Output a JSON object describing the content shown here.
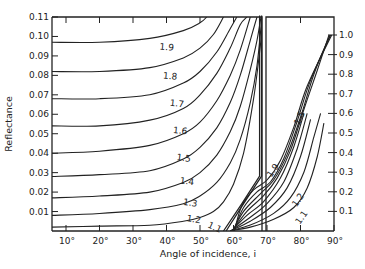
{
  "chart_data": {
    "type": "line",
    "title": "",
    "xlabel": "Angle of incidence, i",
    "ylabel_left": "Reflectance",
    "ylabel_right": "",
    "x_ticks": [
      "10°",
      "20°",
      "30°",
      "40°",
      "50°",
      "60°",
      "70°",
      "80°",
      "90°"
    ],
    "x_tick_values": [
      10,
      20,
      30,
      40,
      50,
      60,
      70,
      80,
      90
    ],
    "y_left_ticks": [
      "0.01",
      "0.02",
      "0.03",
      "0.04",
      "0.05",
      "0.06",
      "0.07",
      "0.08",
      "0.09",
      "0.10",
      "0.11"
    ],
    "y_left_values": [
      0.01,
      0.02,
      0.03,
      0.04,
      0.05,
      0.06,
      0.07,
      0.08,
      0.09,
      0.1,
      0.11
    ],
    "y_right_ticks": [
      "0.1",
      "0.2",
      "0.3",
      "0.4",
      "0.5",
      "0.6",
      "0.7",
      "0.8",
      "0.9",
      "1.0"
    ],
    "y_right_values": [
      0.1,
      0.2,
      0.3,
      0.4,
      0.5,
      0.6,
      0.7,
      0.8,
      0.9,
      1.0
    ],
    "left_panel": {
      "xlim": [
        5.8,
        68.8
      ],
      "ylim": [
        0,
        0.11
      ],
      "scale": "left"
    },
    "right_panel": {
      "xlim": [
        69.9,
        90
      ],
      "ylim": [
        0,
        1.1
      ],
      "scale": "right"
    },
    "grid": false,
    "legend": "inline curve labels (refractive index)",
    "series_left": [
      {
        "name": "1.9",
        "points": [
          [
            5.8,
            0.097
          ],
          [
            20,
            0.097
          ],
          [
            35,
            0.099
          ],
          [
            45,
            0.103
          ],
          [
            50,
            0.107
          ],
          [
            52,
            0.11
          ]
        ]
      },
      {
        "name": "1.8",
        "points": [
          [
            5.8,
            0.082
          ],
          [
            20,
            0.082
          ],
          [
            35,
            0.084
          ],
          [
            45,
            0.089
          ],
          [
            50,
            0.094
          ],
          [
            54,
            0.101
          ],
          [
            57,
            0.11
          ]
        ]
      },
      {
        "name": "1.7",
        "points": [
          [
            5.8,
            0.068
          ],
          [
            20,
            0.068
          ],
          [
            35,
            0.07
          ],
          [
            45,
            0.076
          ],
          [
            50,
            0.082
          ],
          [
            55,
            0.092
          ],
          [
            59,
            0.104
          ],
          [
            61,
            0.11
          ]
        ]
      },
      {
        "name": "1.6",
        "points": [
          [
            5.8,
            0.054
          ],
          [
            20,
            0.054
          ],
          [
            35,
            0.057
          ],
          [
            45,
            0.063
          ],
          [
            50,
            0.07
          ],
          [
            55,
            0.081
          ],
          [
            59,
            0.094
          ],
          [
            62,
            0.106
          ],
          [
            64,
            0.11
          ]
        ]
      },
      {
        "name": "1.5",
        "points": [
          [
            5.8,
            0.04
          ],
          [
            20,
            0.041
          ],
          [
            35,
            0.044
          ],
          [
            45,
            0.05
          ],
          [
            50,
            0.056
          ],
          [
            55,
            0.067
          ],
          [
            59,
            0.08
          ],
          [
            62,
            0.093
          ],
          [
            65,
            0.11
          ]
        ]
      },
      {
        "name": "1.4",
        "points": [
          [
            5.8,
            0.028
          ],
          [
            20,
            0.029
          ],
          [
            35,
            0.031
          ],
          [
            45,
            0.037
          ],
          [
            50,
            0.043
          ],
          [
            55,
            0.053
          ],
          [
            59,
            0.066
          ],
          [
            62,
            0.08
          ],
          [
            65,
            0.098
          ],
          [
            67,
            0.11
          ]
        ]
      },
      {
        "name": "1.3",
        "points": [
          [
            5.8,
            0.017
          ],
          [
            20,
            0.018
          ],
          [
            35,
            0.02
          ],
          [
            45,
            0.025
          ],
          [
            50,
            0.03
          ],
          [
            55,
            0.039
          ],
          [
            59,
            0.051
          ],
          [
            62,
            0.064
          ],
          [
            65,
            0.083
          ],
          [
            67,
            0.098
          ],
          [
            68.2,
            0.11
          ]
        ]
      },
      {
        "name": "1.2",
        "points": [
          [
            5.8,
            0.008
          ],
          [
            20,
            0.009
          ],
          [
            35,
            0.011
          ],
          [
            45,
            0.014
          ],
          [
            50,
            0.018
          ],
          [
            55,
            0.025
          ],
          [
            59,
            0.035
          ],
          [
            62,
            0.047
          ],
          [
            65,
            0.066
          ],
          [
            67,
            0.085
          ],
          [
            68.5,
            0.11
          ]
        ]
      },
      {
        "name": "1.1",
        "points": [
          [
            5.8,
            0.002
          ],
          [
            20,
            0.0025
          ],
          [
            35,
            0.003
          ],
          [
            45,
            0.005
          ],
          [
            50,
            0.007
          ],
          [
            54,
            0.01
          ],
          [
            57,
            0.015
          ],
          [
            60,
            0.024
          ],
          [
            63,
            0.04
          ],
          [
            66,
            0.068
          ],
          [
            68,
            0.095
          ],
          [
            68.8,
            0.11
          ]
        ]
      }
    ],
    "series_right": [
      {
        "name": "1.1",
        "points": [
          [
            58.5,
            0.0
          ],
          [
            65,
            0.02
          ],
          [
            72,
            0.06
          ],
          [
            78,
            0.12
          ],
          [
            82,
            0.22
          ],
          [
            85,
            0.38
          ],
          [
            87,
            0.55
          ]
        ]
      },
      {
        "name": "1.2",
        "points": [
          [
            58.8,
            0.0
          ],
          [
            65,
            0.03
          ],
          [
            72,
            0.09
          ],
          [
            77,
            0.17
          ],
          [
            81,
            0.3
          ],
          [
            84,
            0.48
          ],
          [
            86,
            0.6
          ]
        ]
      },
      {
        "name": "1.3",
        "points": [
          [
            59,
            0.0
          ],
          [
            65,
            0.05
          ],
          [
            71,
            0.12
          ],
          [
            76,
            0.22
          ],
          [
            80,
            0.38
          ],
          [
            83,
            0.57
          ]
        ]
      },
      {
        "name": "1.4",
        "points": [
          [
            59.2,
            0.0
          ],
          [
            65,
            0.07
          ],
          [
            70,
            0.14
          ],
          [
            75,
            0.25
          ],
          [
            79,
            0.42
          ],
          [
            82,
            0.6
          ]
        ]
      },
      {
        "name": "1.5",
        "points": [
          [
            59.4,
            0.0
          ],
          [
            64,
            0.08
          ],
          [
            69,
            0.15
          ],
          [
            74,
            0.27
          ],
          [
            78,
            0.43
          ],
          [
            81,
            0.6
          ]
        ]
      },
      {
        "name": "1.6",
        "points": [
          [
            59.6,
            0.0
          ],
          [
            64,
            0.1
          ],
          [
            69,
            0.18
          ],
          [
            73,
            0.27
          ],
          [
            77,
            0.41
          ],
          [
            81,
            0.62
          ],
          [
            85,
            0.82
          ],
          [
            88.5,
            1.0
          ]
        ]
      },
      {
        "name": "1.7",
        "points": [
          [
            59.8,
            0.0
          ],
          [
            63,
            0.1
          ],
          [
            68,
            0.19
          ],
          [
            72,
            0.26
          ],
          [
            76,
            0.39
          ],
          [
            80,
            0.58
          ],
          [
            84,
            0.8
          ],
          [
            88.8,
            1.0
          ]
        ]
      },
      {
        "name": "1.8",
        "points": [
          [
            60,
            0.0
          ],
          [
            63,
            0.12
          ],
          [
            67,
            0.2
          ],
          [
            71,
            0.25
          ],
          [
            75,
            0.37
          ],
          [
            79,
            0.56
          ],
          [
            83,
            0.77
          ],
          [
            89,
            1.0
          ]
        ]
      },
      {
        "name": "1.9",
        "points": [
          [
            60.2,
            0.0
          ],
          [
            62.5,
            0.13
          ],
          [
            66,
            0.21
          ],
          [
            70,
            0.26
          ],
          [
            74,
            0.36
          ],
          [
            78,
            0.53
          ],
          [
            82,
            0.74
          ],
          [
            89.3,
            1.0
          ]
        ]
      }
    ],
    "boundary_line": {
      "points_left": [
        [
          57,
          0
        ],
        [
          62.5,
          0.14
        ],
        [
          67.8,
          0.28
        ],
        [
          67.8,
          1.1
        ]
      ],
      "points_right": [
        [
          57.8,
          0
        ],
        [
          63,
          0.14
        ],
        [
          68.4,
          0.28
        ],
        [
          68.4,
          1.1
        ]
      ]
    },
    "annotations": [
      {
        "text": "1.9",
        "x": 40,
        "y": 0.093,
        "panel": "left",
        "rot": 5
      },
      {
        "text": "1.8",
        "x": 41,
        "y": 0.078,
        "panel": "left",
        "rot": 5
      },
      {
        "text": "1.7",
        "x": 43,
        "y": 0.064,
        "panel": "left",
        "rot": 6
      },
      {
        "text": "1.6",
        "x": 44,
        "y": 0.05,
        "panel": "left",
        "rot": 6
      },
      {
        "text": "1.5",
        "x": 45,
        "y": 0.036,
        "panel": "left",
        "rot": 7
      },
      {
        "text": "1.4",
        "x": 46,
        "y": 0.024,
        "panel": "left",
        "rot": 7
      },
      {
        "text": "1.3",
        "x": 47,
        "y": 0.013,
        "panel": "left",
        "rot": 8
      },
      {
        "text": "1.2",
        "x": 48,
        "y": 0.0045,
        "panel": "left",
        "rot": 9
      },
      {
        "text": "1.1",
        "x": 54,
        "y": 0.0005,
        "panel": "left",
        "rot": 25
      },
      {
        "text": "1.9",
        "x": 72.5,
        "y": 0.3,
        "panel": "right",
        "rot": -55
      },
      {
        "text": "1.5",
        "x": 80.5,
        "y": 0.57,
        "panel": "right",
        "rot": -65
      },
      {
        "text": "1.2",
        "x": 80,
        "y": 0.15,
        "panel": "right",
        "rot": -55
      },
      {
        "text": "1.1",
        "x": 81,
        "y": 0.06,
        "panel": "right",
        "rot": -55
      }
    ]
  }
}
